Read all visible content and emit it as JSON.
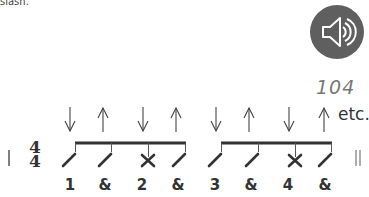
{
  "caption": "slash.",
  "audio": {
    "icon": "speaker-icon",
    "tempo": "104",
    "bg_color": "#5f5f5f"
  },
  "notation": {
    "time_signature": {
      "top": "4",
      "bottom": "4"
    },
    "strums": [
      {
        "dir": "down",
        "note": "slash",
        "count": "1"
      },
      {
        "dir": "up",
        "note": "slash",
        "count": "&"
      },
      {
        "dir": "down",
        "note": "x",
        "count": "2"
      },
      {
        "dir": "up",
        "note": "slash",
        "count": "&"
      },
      {
        "dir": "down",
        "note": "slash",
        "count": "3"
      },
      {
        "dir": "up",
        "note": "slash",
        "count": "&"
      },
      {
        "dir": "down",
        "note": "x",
        "count": "4"
      },
      {
        "dir": "up",
        "note": "slash",
        "count": "&"
      }
    ],
    "continuation": "etc."
  }
}
